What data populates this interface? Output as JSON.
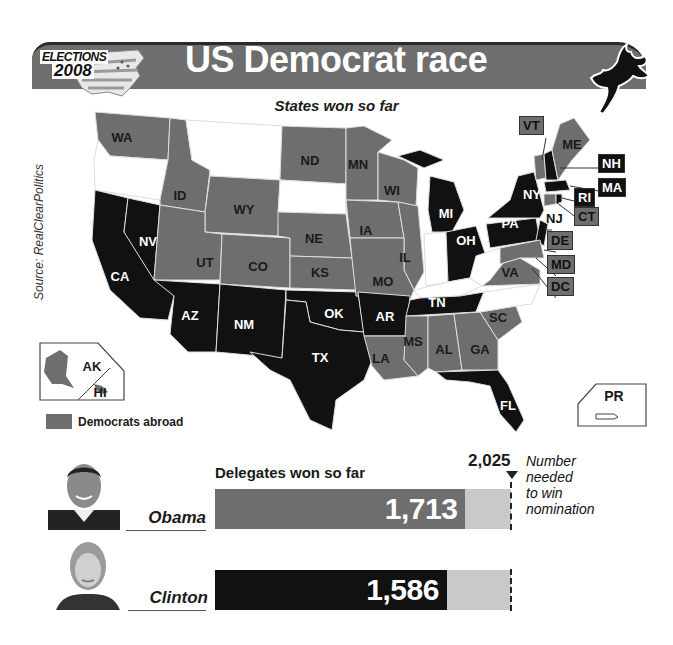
{
  "header": {
    "logo_line1": "ELECTIONS",
    "logo_line2": "2008",
    "title": "US Democrat race",
    "subtitle": "States won so far"
  },
  "source": "Source: RealClearPolitics",
  "colors": {
    "obama": "#6e6e6e",
    "clinton": "#111111",
    "undecided": "#ffffff",
    "remaining": "#c9c9c9"
  },
  "legend": {
    "label": "Democrats abroad",
    "color": "#6e6e6e"
  },
  "map": {
    "states_obama": [
      "WA",
      "ID",
      "WY",
      "ND",
      "MN",
      "WI",
      "NE",
      "IA",
      "IL",
      "CO",
      "UT",
      "KS",
      "MO",
      "LA",
      "MS",
      "AL",
      "GA",
      "SC",
      "VA",
      "ME",
      "VT",
      "CT",
      "DE",
      "MD",
      "DC",
      "AK",
      "HI"
    ],
    "states_clinton": [
      "CA",
      "NV",
      "AZ",
      "NM",
      "TX",
      "OK",
      "AR",
      "TN",
      "OH",
      "MI",
      "PA",
      "NY",
      "NJ",
      "NH",
      "MA",
      "RI",
      "FL"
    ],
    "states_undecided": [
      "OR",
      "MT",
      "SD",
      "IN",
      "KY",
      "WV",
      "NC",
      "PR"
    ],
    "labels": [
      {
        "id": "WA",
        "x": 122,
        "y": 137,
        "winner": "obama"
      },
      {
        "id": "ID",
        "x": 180,
        "y": 195,
        "winner": "obama"
      },
      {
        "id": "WY",
        "x": 244,
        "y": 209,
        "winner": "obama"
      },
      {
        "id": "ND",
        "x": 310,
        "y": 160,
        "winner": "obama"
      },
      {
        "id": "MN",
        "x": 358,
        "y": 164,
        "winner": "obama"
      },
      {
        "id": "WI",
        "x": 392,
        "y": 190,
        "winner": "obama"
      },
      {
        "id": "NE",
        "x": 314,
        "y": 238,
        "winner": "obama"
      },
      {
        "id": "IA",
        "x": 366,
        "y": 230,
        "winner": "obama"
      },
      {
        "id": "IL",
        "x": 405,
        "y": 257,
        "winner": "obama"
      },
      {
        "id": "UT",
        "x": 205,
        "y": 262,
        "winner": "obama"
      },
      {
        "id": "CO",
        "x": 258,
        "y": 266,
        "winner": "obama"
      },
      {
        "id": "KS",
        "x": 320,
        "y": 272,
        "winner": "obama"
      },
      {
        "id": "MO",
        "x": 383,
        "y": 281,
        "winner": "obama"
      },
      {
        "id": "NV",
        "x": 148,
        "y": 241,
        "winner": "clinton"
      },
      {
        "id": "CA",
        "x": 120,
        "y": 276,
        "winner": "clinton"
      },
      {
        "id": "AZ",
        "x": 190,
        "y": 315,
        "winner": "clinton"
      },
      {
        "id": "NM",
        "x": 244,
        "y": 324,
        "winner": "clinton"
      },
      {
        "id": "OK",
        "x": 334,
        "y": 313,
        "winner": "clinton"
      },
      {
        "id": "AR",
        "x": 385,
        "y": 316,
        "winner": "clinton"
      },
      {
        "id": "TX",
        "x": 320,
        "y": 357,
        "winner": "clinton"
      },
      {
        "id": "LA",
        "x": 381,
        "y": 358,
        "winner": "obama"
      },
      {
        "id": "TN",
        "x": 437,
        "y": 302,
        "winner": "clinton"
      },
      {
        "id": "MS",
        "x": 413,
        "y": 341,
        "winner": "obama"
      },
      {
        "id": "AL",
        "x": 444,
        "y": 349,
        "winner": "obama"
      },
      {
        "id": "GA",
        "x": 480,
        "y": 349,
        "winner": "obama"
      },
      {
        "id": "SC",
        "x": 498,
        "y": 317,
        "winner": "obama"
      },
      {
        "id": "FL",
        "x": 508,
        "y": 405,
        "winner": "clinton"
      },
      {
        "id": "MI",
        "x": 446,
        "y": 213,
        "winner": "clinton"
      },
      {
        "id": "OH",
        "x": 466,
        "y": 240,
        "winner": "clinton"
      },
      {
        "id": "PA",
        "x": 510,
        "y": 223,
        "winner": "clinton"
      },
      {
        "id": "NY",
        "x": 532,
        "y": 194,
        "winner": "clinton"
      },
      {
        "id": "VA",
        "x": 510,
        "y": 272,
        "winner": "obama"
      },
      {
        "id": "ME",
        "x": 572,
        "y": 144,
        "winner": "obama"
      }
    ],
    "callouts": [
      {
        "id": "VT",
        "x": 533,
        "y": 125,
        "style": "gray"
      },
      {
        "id": "NH",
        "x": 612,
        "y": 163,
        "style": "dark"
      },
      {
        "id": "MA",
        "x": 612,
        "y": 187,
        "style": "dark"
      },
      {
        "id": "RI",
        "x": 588,
        "y": 197,
        "style": "dark"
      },
      {
        "id": "CT",
        "x": 588,
        "y": 216,
        "style": "gray"
      },
      {
        "id": "NJ",
        "x": 557,
        "y": 219,
        "style": "plain"
      },
      {
        "id": "DE",
        "x": 561,
        "y": 240,
        "style": "gray"
      },
      {
        "id": "MD",
        "x": 561,
        "y": 264,
        "style": "gray"
      },
      {
        "id": "DC",
        "x": 561,
        "y": 286,
        "style": "gray"
      }
    ],
    "insets": {
      "ak_label": "AK",
      "hi_label": "HI",
      "pr_label": "PR"
    }
  },
  "delegates": {
    "title": "Delegates won so far",
    "needed_value": "2,025",
    "needed_note_lines": [
      "Number",
      "needed",
      "to win",
      "nomination"
    ],
    "needed_number": 2025
  },
  "candidates": [
    {
      "name": "Obama",
      "delegates": 1713,
      "delegates_label": "1,713"
    },
    {
      "name": "Clinton",
      "delegates": 1586,
      "delegates_label": "1,586"
    }
  ],
  "chart_data": {
    "type": "bar",
    "subtitle": "States won so far",
    "categories": [
      "Obama",
      "Clinton"
    ],
    "values": [
      1713,
      1586
    ],
    "orientation": "horizontal",
    "target": {
      "value": 2025,
      "label": "Number needed to win nomination"
    },
    "xlim": [
      0,
      2025
    ],
    "source": "Source: RealClearPolitics",
    "legend": [
      {
        "label": "Obama (states won)",
        "color": "#6e6e6e"
      },
      {
        "label": "Clinton (states won)",
        "color": "#111111"
      },
      {
        "label": "Democrats abroad",
        "color": "#6e6e6e"
      }
    ],
    "states_won": {
      "Obama": [
        "WA",
        "ID",
        "WY",
        "ND",
        "MN",
        "WI",
        "NE",
        "IA",
        "IL",
        "CO",
        "UT",
        "KS",
        "MO",
        "LA",
        "MS",
        "AL",
        "GA",
        "SC",
        "VA",
        "ME",
        "VT",
        "CT",
        "DE",
        "MD",
        "DC",
        "AK",
        "HI"
      ],
      "Clinton": [
        "CA",
        "NV",
        "AZ",
        "NM",
        "TX",
        "OK",
        "AR",
        "TN",
        "OH",
        "MI",
        "PA",
        "NY",
        "NJ",
        "NH",
        "MA",
        "RI",
        "FL"
      ],
      "Not yet voted": [
        "OR",
        "MT",
        "SD",
        "IN",
        "KY",
        "WV",
        "NC",
        "PR"
      ]
    }
  }
}
